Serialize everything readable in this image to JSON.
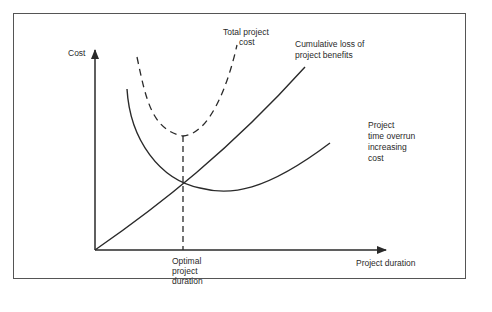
{
  "diagram": {
    "type": "cost-duration-tradeoff",
    "axes": {
      "y_label": "Cost",
      "x_label": "Project duration"
    },
    "curves": {
      "total_cost": {
        "label_lines": [
          "Total project",
          "cost"
        ],
        "style": "dashed"
      },
      "cumulative_loss": {
        "label_lines": [
          "Cumulative loss of",
          "project benefits"
        ],
        "style": "solid"
      },
      "time_overrun": {
        "label_lines": [
          "Project",
          "time overrun",
          "increasing",
          "cost"
        ],
        "style": "solid"
      }
    },
    "optimal_marker": {
      "label_lines": [
        "Optimal",
        "project",
        "duration"
      ],
      "style": "dashed"
    },
    "colors": {
      "line": "#2a2a2a",
      "frame": "#555555",
      "background": "#ffffff"
    }
  }
}
